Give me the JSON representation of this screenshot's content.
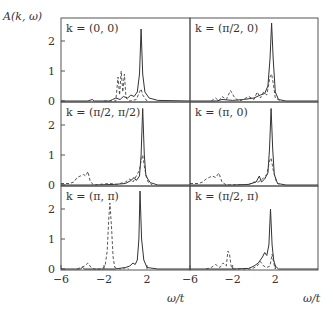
{
  "figure": {
    "ylabel": "A(k, ω)",
    "xlabel": "ω/t",
    "ytick_labels": [
      "0",
      "1",
      "2"
    ],
    "xtick_labels": [
      "−6",
      "−2",
      "2"
    ]
  },
  "chart_data": {
    "type": "line",
    "title": "",
    "xlabel": "ω/t",
    "ylabel": "A(k, ω)",
    "xlim": [
      -6,
      6
    ],
    "ylim": [
      0,
      2.75
    ],
    "xticks": [
      -6,
      -2,
      2
    ],
    "yticks": [
      0,
      1,
      2
    ],
    "layout": "3 rows × 2 columns, shared axes",
    "legend": "none (solid and dashed curves)",
    "panels": [
      {
        "label": "k = (0, 0)",
        "row": 0,
        "col": 0,
        "series": [
          {
            "name": "solid",
            "style": "solid",
            "points": [
              [
                -6,
                0
              ],
              [
                -3.5,
                0
              ],
              [
                -3.1,
                0.05
              ],
              [
                -2.9,
                0
              ],
              [
                -1.5,
                0
              ],
              [
                -1.2,
                0.05
              ],
              [
                -0.9,
                0.1
              ],
              [
                -0.5,
                0.05
              ],
              [
                -0.2,
                0.15
              ],
              [
                0.2,
                0.1
              ],
              [
                0.5,
                0.2
              ],
              [
                0.8,
                0.15
              ],
              [
                1.1,
                0.3
              ],
              [
                1.3,
                0.9
              ],
              [
                1.45,
                2.4
              ],
              [
                1.6,
                0.9
              ],
              [
                1.8,
                0.3
              ],
              [
                2.2,
                0.1
              ],
              [
                3,
                0.02
              ],
              [
                6,
                0
              ]
            ]
          },
          {
            "name": "dashed",
            "style": "dashed",
            "points": [
              [
                -2,
                0
              ],
              [
                -0.9,
                0
              ],
              [
                -0.7,
                0.8
              ],
              [
                -0.55,
                0.2
              ],
              [
                -0.4,
                1.0
              ],
              [
                -0.25,
                0.3
              ],
              [
                -0.1,
                0.9
              ],
              [
                0.05,
                0.1
              ],
              [
                0.4,
                0
              ],
              [
                1.0,
                0.05
              ],
              [
                1.3,
                0.3
              ],
              [
                1.45,
                0.4
              ],
              [
                1.6,
                0.2
              ],
              [
                2,
                0
              ]
            ]
          }
        ]
      },
      {
        "label": "k = (π/2, 0)",
        "row": 0,
        "col": 1,
        "series": [
          {
            "name": "solid",
            "style": "solid",
            "points": [
              [
                -6,
                0
              ],
              [
                -3.5,
                0
              ],
              [
                -3,
                0.05
              ],
              [
                -2,
                0.02
              ],
              [
                -1,
                0.05
              ],
              [
                0,
                0.1
              ],
              [
                0.6,
                0.2
              ],
              [
                1.0,
                0.25
              ],
              [
                1.3,
                0.5
              ],
              [
                1.5,
                1.4
              ],
              [
                1.65,
                2.6
              ],
              [
                1.8,
                1.4
              ],
              [
                2.0,
                0.3
              ],
              [
                2.3,
                0.05
              ],
              [
                3,
                0
              ],
              [
                6,
                0
              ]
            ]
          },
          {
            "name": "dashed",
            "style": "dashed",
            "points": [
              [
                -4,
                0
              ],
              [
                -3.6,
                0.1
              ],
              [
                -3.3,
                0
              ],
              [
                -3.0,
                0.15
              ],
              [
                -2.6,
                0.05
              ],
              [
                -2.2,
                0.35
              ],
              [
                -1.8,
                0.1
              ],
              [
                -1.4,
                0
              ],
              [
                -1,
                0.05
              ],
              [
                -0.5,
                0.15
              ],
              [
                0,
                0.05
              ],
              [
                0.3,
                0.3
              ],
              [
                0.6,
                0.1
              ],
              [
                0.9,
                0.3
              ],
              [
                1.2,
                0.2
              ],
              [
                1.5,
                0.8
              ],
              [
                1.65,
                0.9
              ],
              [
                1.8,
                0.6
              ],
              [
                2.0,
                0.1
              ],
              [
                2.5,
                0
              ]
            ]
          }
        ]
      },
      {
        "label": "k = (π/2, π/2)",
        "row": 1,
        "col": 0,
        "series": [
          {
            "name": "solid",
            "style": "solid",
            "points": [
              [
                -6,
                0
              ],
              [
                -3,
                0
              ],
              [
                -1,
                0.02
              ],
              [
                0,
                0.05
              ],
              [
                0.5,
                0.15
              ],
              [
                0.8,
                0.25
              ],
              [
                1.0,
                0.15
              ],
              [
                1.3,
                0.3
              ],
              [
                1.45,
                1.0
              ],
              [
                1.6,
                2.55
              ],
              [
                1.75,
                1.0
              ],
              [
                1.9,
                0.3
              ],
              [
                2.3,
                0.08
              ],
              [
                3,
                0
              ],
              [
                6,
                0
              ]
            ]
          },
          {
            "name": "dashed",
            "style": "dashed",
            "points": [
              [
                -6,
                0.05
              ],
              [
                -5.2,
                0.05
              ],
              [
                -4.8,
                0.1
              ],
              [
                -4.5,
                0.25
              ],
              [
                -4.2,
                0.3
              ],
              [
                -3.9,
                0.35
              ],
              [
                -3.7,
                0.3
              ],
              [
                -3.5,
                0.45
              ],
              [
                -3.3,
                0.15
              ],
              [
                -3.0,
                0
              ],
              [
                -1.5,
                0.05
              ],
              [
                -0.8,
                0.02
              ],
              [
                0,
                0.1
              ],
              [
                0.4,
                0.2
              ],
              [
                0.7,
                0.1
              ],
              [
                1.0,
                0.3
              ],
              [
                1.3,
                0.5
              ],
              [
                1.45,
                0.8
              ],
              [
                1.6,
                1.0
              ],
              [
                1.8,
                0.5
              ],
              [
                2.1,
                0.1
              ],
              [
                2.5,
                0
              ]
            ]
          }
        ]
      },
      {
        "label": "k = (π, 0)",
        "row": 1,
        "col": 1,
        "series": [
          {
            "name": "solid",
            "style": "solid",
            "points": [
              [
                -6,
                0
              ],
              [
                -2,
                0
              ],
              [
                -0.5,
                0.02
              ],
              [
                0.2,
                0.1
              ],
              [
                0.5,
                0.3
              ],
              [
                0.7,
                0.1
              ],
              [
                1.0,
                0.2
              ],
              [
                1.3,
                0.4
              ],
              [
                1.45,
                1.2
              ],
              [
                1.6,
                2.55
              ],
              [
                1.75,
                1.2
              ],
              [
                1.9,
                0.35
              ],
              [
                2.2,
                0.05
              ],
              [
                3,
                0
              ],
              [
                6,
                0
              ]
            ]
          },
          {
            "name": "dashed",
            "style": "dashed",
            "points": [
              [
                -6,
                0.05
              ],
              [
                -5.2,
                0.05
              ],
              [
                -4.8,
                0.1
              ],
              [
                -4.5,
                0.2
              ],
              [
                -4.2,
                0.25
              ],
              [
                -3.9,
                0.3
              ],
              [
                -3.6,
                0.25
              ],
              [
                -3.3,
                0.4
              ],
              [
                -3.0,
                0.1
              ],
              [
                -2.6,
                0
              ],
              [
                -0.5,
                0.02
              ],
              [
                0,
                0.1
              ],
              [
                0.4,
                0.1
              ],
              [
                0.8,
                0.2
              ],
              [
                1.2,
                0.35
              ],
              [
                1.45,
                0.8
              ],
              [
                1.6,
                0.9
              ],
              [
                1.8,
                0.5
              ],
              [
                2.1,
                0.1
              ],
              [
                2.4,
                0
              ]
            ]
          }
        ]
      },
      {
        "label": "k = (π, π)",
        "row": 2,
        "col": 0,
        "series": [
          {
            "name": "solid",
            "style": "solid",
            "points": [
              [
                -6,
                0
              ],
              [
                -4.2,
                0
              ],
              [
                -4.0,
                0.05
              ],
              [
                -3.8,
                0
              ],
              [
                -1,
                0
              ],
              [
                0,
                0.05
              ],
              [
                0.4,
                0.1
              ],
              [
                0.7,
                0.2
              ],
              [
                0.9,
                0.15
              ],
              [
                1.1,
                0.3
              ],
              [
                1.25,
                1.0
              ],
              [
                1.35,
                2.6
              ],
              [
                1.5,
                1.0
              ],
              [
                1.7,
                0.3
              ],
              [
                2.0,
                0.05
              ],
              [
                3,
                0
              ],
              [
                6,
                0
              ]
            ]
          },
          {
            "name": "dashed",
            "style": "dashed",
            "points": [
              [
                -4.5,
                0
              ],
              [
                -3.8,
                0.1
              ],
              [
                -3.5,
                0.2
              ],
              [
                -3.2,
                0.05
              ],
              [
                -2.9,
                0
              ],
              [
                -2.2,
                0
              ],
              [
                -1.9,
                0.1
              ],
              [
                -1.7,
                0.6
              ],
              [
                -1.55,
                1.7
              ],
              [
                -1.45,
                2.2
              ],
              [
                -1.3,
                1.4
              ],
              [
                -1.15,
                0.4
              ],
              [
                -1.0,
                0.05
              ],
              [
                -0.5,
                0
              ],
              [
                0.1,
                0.05
              ],
              [
                0.3,
                0
              ]
            ]
          }
        ]
      },
      {
        "label": "k = (π/2, π)",
        "row": 2,
        "col": 1,
        "series": [
          {
            "name": "solid",
            "style": "solid",
            "points": [
              [
                -6,
                0
              ],
              [
                -2,
                0
              ],
              [
                -0.5,
                0.02
              ],
              [
                0,
                0.1
              ],
              [
                0.4,
                0.2
              ],
              [
                0.8,
                0.4
              ],
              [
                1.0,
                0.55
              ],
              [
                1.2,
                0.45
              ],
              [
                1.4,
                0.8
              ],
              [
                1.55,
                2.0
              ],
              [
                1.7,
                0.8
              ],
              [
                1.85,
                0.3
              ],
              [
                2.0,
                0.1
              ],
              [
                2.3,
                0
              ],
              [
                6,
                0
              ]
            ]
          },
          {
            "name": "dashed",
            "style": "dashed",
            "points": [
              [
                -4.5,
                0
              ],
              [
                -4.0,
                0.05
              ],
              [
                -3.6,
                0.15
              ],
              [
                -3.2,
                0.05
              ],
              [
                -2.9,
                0.2
              ],
              [
                -2.6,
                0.1
              ],
              [
                -2.45,
                0.6
              ],
              [
                -2.3,
                0.5
              ],
              [
                -2.15,
                0.1
              ],
              [
                -2.0,
                0
              ],
              [
                -0.2,
                0
              ],
              [
                0.3,
                0.1
              ],
              [
                0.6,
                0.25
              ],
              [
                0.9,
                0.1
              ],
              [
                1.2,
                0.05
              ],
              [
                1.5,
                0.1
              ],
              [
                1.7,
                0.5
              ],
              [
                1.85,
                0.2
              ],
              [
                2.0,
                0
              ]
            ]
          }
        ]
      }
    ]
  }
}
